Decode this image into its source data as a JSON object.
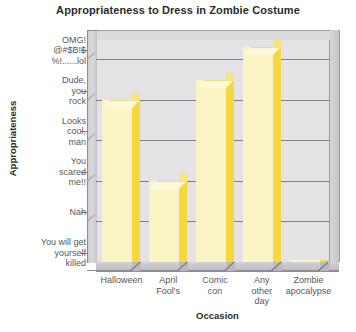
{
  "chart_data": {
    "type": "bar",
    "title": "Appropriateness to Dress in Zombie Costume",
    "xlabel": "Occasion",
    "ylabel": "Appropriateness",
    "categories": [
      "Halloween",
      "April Fool's",
      "Comic con",
      "Any other day",
      "Zombie apocalypse"
    ],
    "category_lines": [
      [
        "Halloween"
      ],
      [
        "April",
        "Fool's"
      ],
      [
        "Comic",
        "con"
      ],
      [
        "Any",
        "other",
        "day"
      ],
      [
        "Zombie",
        "apocalypse"
      ]
    ],
    "values": [
      4,
      2,
      4.5,
      5.3,
      0.05
    ],
    "ytick_labels": [
      "You will get yourself killed",
      "Nah",
      "You scared me!!",
      "Looks cool, man",
      "Dude, you rock",
      "OMG! @#$B!$ %!......lol"
    ],
    "ytick_lines": [
      [
        "You will get",
        "yourself",
        "killed"
      ],
      [
        "Nah"
      ],
      [
        "You",
        "scared",
        "me!!"
      ],
      [
        "Looks",
        "cool,",
        "man"
      ],
      [
        "Dude,",
        "you",
        "rock"
      ],
      [
        "OMG!",
        "@#$B!$",
        "%!......lol"
      ]
    ],
    "ylim": [
      0,
      5.5
    ],
    "grid": true,
    "legend": "none",
    "style": "3d-bar",
    "colors": {
      "bar_face": "#fbf5c5",
      "bar_side": "#f5d93c",
      "bar_top": "#fdf8d8",
      "plot_background": "#e3e3e5",
      "gridline": "#7f7f85",
      "axis_wall": "#d2d2d6",
      "text": "#58585c",
      "title_text": "#2b2b2b",
      "page_background": "#ffffff"
    }
  }
}
